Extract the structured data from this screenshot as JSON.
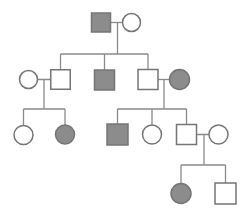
{
  "diagram": {
    "type": "pedigree-chart",
    "canvas": {
      "width": 250,
      "height": 215,
      "background": "#ffffff"
    },
    "colors": {
      "affected_fill": "#8c8c8c",
      "unaffected_fill": "#ffffff",
      "symbol_border": "#757575",
      "line": "#8a8a8a"
    },
    "symbol_legend": {
      "square": "male",
      "circle": "female",
      "filled": "affected",
      "open": "unaffected"
    },
    "symbols": [
      {
        "id": "I-1",
        "generation": 1,
        "sex": "male",
        "affected": true,
        "cx": 101,
        "cy": 22.5,
        "size": 19
      },
      {
        "id": "I-2",
        "generation": 1,
        "sex": "female",
        "affected": false,
        "cx": 131.5,
        "cy": 22.5,
        "size": 18
      },
      {
        "id": "II-1",
        "generation": 2,
        "sex": "female",
        "affected": false,
        "cx": 28.5,
        "cy": 79.5,
        "size": 18
      },
      {
        "id": "II-2",
        "generation": 2,
        "sex": "male",
        "affected": false,
        "cx": 60.5,
        "cy": 79.5,
        "size": 19.5
      },
      {
        "id": "II-3",
        "generation": 2,
        "sex": "male",
        "affected": true,
        "cx": 104.5,
        "cy": 80,
        "size": 20
      },
      {
        "id": "II-4",
        "generation": 2,
        "sex": "male",
        "affected": false,
        "cx": 148,
        "cy": 79.5,
        "size": 20
      },
      {
        "id": "II-5",
        "generation": 2,
        "sex": "female",
        "affected": true,
        "cx": 179.5,
        "cy": 79.5,
        "size": 20
      },
      {
        "id": "III-1",
        "generation": 3,
        "sex": "female",
        "affected": false,
        "cx": 23.5,
        "cy": 135,
        "size": 19
      },
      {
        "id": "III-2",
        "generation": 3,
        "sex": "female",
        "affected": true,
        "cx": 65,
        "cy": 134.5,
        "size": 19
      },
      {
        "id": "III-3",
        "generation": 3,
        "sex": "male",
        "affected": true,
        "cx": 117.5,
        "cy": 134.5,
        "size": 21
      },
      {
        "id": "III-4",
        "generation": 3,
        "sex": "female",
        "affected": false,
        "cx": 152,
        "cy": 134.5,
        "size": 19
      },
      {
        "id": "III-5",
        "generation": 3,
        "sex": "male",
        "affected": false,
        "cx": 186.5,
        "cy": 134.5,
        "size": 20
      },
      {
        "id": "III-6",
        "generation": 3,
        "sex": "female",
        "affected": false,
        "cx": 218.5,
        "cy": 134.5,
        "size": 19
      },
      {
        "id": "IV-1",
        "generation": 4,
        "sex": "female",
        "affected": true,
        "cx": 181,
        "cy": 193.5,
        "size": 20
      },
      {
        "id": "IV-2",
        "generation": 4,
        "sex": "male",
        "affected": false,
        "cx": 225.5,
        "cy": 193.5,
        "size": 21
      }
    ],
    "lines": [
      {
        "kind": "marriage",
        "x1": 101,
        "y1": 22.5,
        "x2": 131.5,
        "y2": 22.5
      },
      {
        "kind": "descent",
        "x1": 117.5,
        "y1": 22.5,
        "x2": 117.5,
        "y2": 54
      },
      {
        "kind": "sibship",
        "x1": 60.5,
        "y1": 54,
        "x2": 148,
        "y2": 54
      },
      {
        "kind": "descent",
        "x1": 60.5,
        "y1": 54,
        "x2": 60.5,
        "y2": 79.5
      },
      {
        "kind": "descent",
        "x1": 104.5,
        "y1": 54,
        "x2": 104.5,
        "y2": 80
      },
      {
        "kind": "descent",
        "x1": 148,
        "y1": 54,
        "x2": 148,
        "y2": 79.5
      },
      {
        "kind": "marriage",
        "x1": 28.5,
        "y1": 79.5,
        "x2": 60.5,
        "y2": 79.5
      },
      {
        "kind": "descent",
        "x1": 44,
        "y1": 79.5,
        "x2": 44,
        "y2": 109
      },
      {
        "kind": "sibship",
        "x1": 23.5,
        "y1": 109,
        "x2": 65,
        "y2": 109
      },
      {
        "kind": "descent",
        "x1": 23.5,
        "y1": 109,
        "x2": 23.5,
        "y2": 135
      },
      {
        "kind": "descent",
        "x1": 65,
        "y1": 109,
        "x2": 65,
        "y2": 134.5
      },
      {
        "kind": "marriage",
        "x1": 148,
        "y1": 79.5,
        "x2": 179.5,
        "y2": 79.5
      },
      {
        "kind": "descent",
        "x1": 164,
        "y1": 79.5,
        "x2": 164,
        "y2": 109
      },
      {
        "kind": "sibship",
        "x1": 117.5,
        "y1": 109,
        "x2": 186.5,
        "y2": 109
      },
      {
        "kind": "descent",
        "x1": 117.5,
        "y1": 109,
        "x2": 117.5,
        "y2": 134.5
      },
      {
        "kind": "descent",
        "x1": 152,
        "y1": 109,
        "x2": 152,
        "y2": 134.5
      },
      {
        "kind": "descent",
        "x1": 186.5,
        "y1": 109,
        "x2": 186.5,
        "y2": 134.5
      },
      {
        "kind": "marriage",
        "x1": 186.5,
        "y1": 134.5,
        "x2": 218.5,
        "y2": 134.5
      },
      {
        "kind": "descent",
        "x1": 204,
        "y1": 134.5,
        "x2": 204,
        "y2": 165
      },
      {
        "kind": "sibship",
        "x1": 181,
        "y1": 165,
        "x2": 225.5,
        "y2": 165
      },
      {
        "kind": "descent",
        "x1": 181,
        "y1": 165,
        "x2": 181,
        "y2": 193.5
      },
      {
        "kind": "descent",
        "x1": 225.5,
        "y1": 165,
        "x2": 225.5,
        "y2": 193.5
      }
    ],
    "stroke": {
      "line_width": 1.3,
      "symbol_width": 1.5
    }
  }
}
